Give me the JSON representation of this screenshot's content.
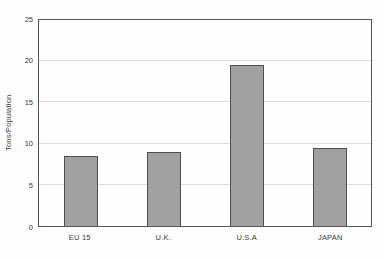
{
  "chart_data": {
    "type": "bar",
    "categories": [
      "EU 15",
      "U.K.",
      "U.S.A",
      "JAPAN"
    ],
    "values": [
      8.5,
      9,
      19.5,
      9.5
    ],
    "title": "",
    "xlabel": "",
    "ylabel": "Tons/Population",
    "ylim": [
      0,
      25
    ],
    "yticks": [
      0,
      5,
      10,
      15,
      20,
      25
    ],
    "grid": "horizontal-only",
    "legend_position": "none",
    "bar_width_px": 34
  },
  "colors": {
    "page_background": "#fdfdfd",
    "bar_fill": "#a1a1a1",
    "bar_border": "#4f4f4f",
    "plot_border": "#565656",
    "gridline": "#dcdcdc",
    "text": "#3a3a3a"
  }
}
